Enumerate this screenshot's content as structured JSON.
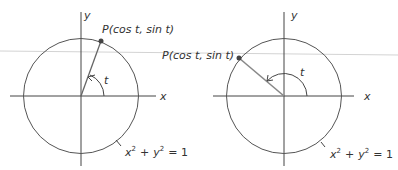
{
  "figure": {
    "left": {
      "point_label_prefix": "P",
      "point_label_args": "(cos t, sin t)",
      "angle_label": "t",
      "x_axis_label": "x",
      "y_axis_label": "y",
      "equation": {
        "x": "x",
        "exp1": "2",
        "plus": "+",
        "y": "y",
        "exp2": "2",
        "equals": "= 1"
      },
      "angle_degrees": 70
    },
    "right": {
      "point_label_prefix": "P",
      "point_label_args": "(cos t, sin t)",
      "angle_label": "t",
      "x_axis_label": "x",
      "y_axis_label": "y",
      "equation": {
        "x": "x",
        "exp1": "2",
        "plus": "+",
        "y": "y",
        "exp2": "2",
        "equals": "= 1"
      },
      "angle_degrees": 140
    },
    "colors": {
      "stroke": "#444444",
      "radius_left": "#666666",
      "radius_right": "#888888",
      "guide_line": "#d0d0d0",
      "point": "#444444"
    }
  }
}
